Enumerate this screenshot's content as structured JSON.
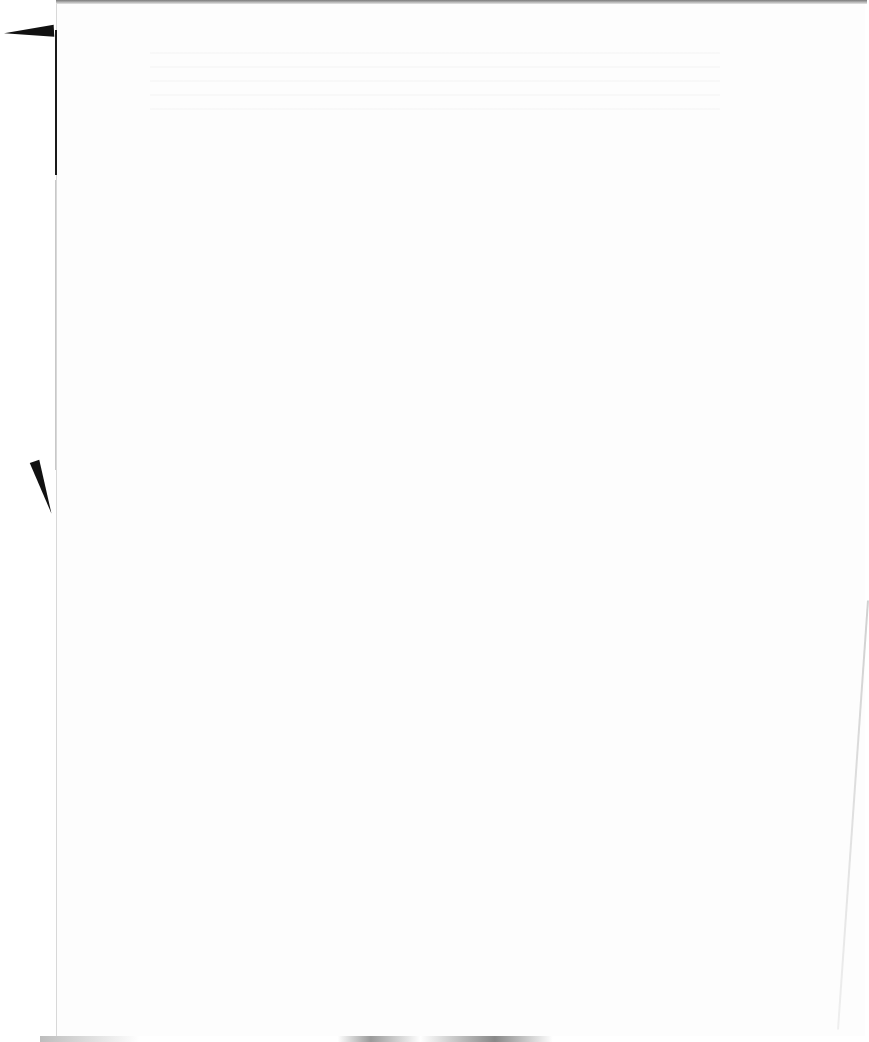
{
  "document": {
    "type": "scanned-page",
    "content": "",
    "background_color": "#fdfdfd",
    "edge_color": "#1a1a1a"
  }
}
